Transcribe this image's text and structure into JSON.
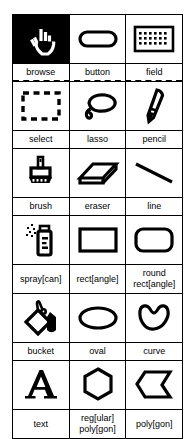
{
  "palette": {
    "title": "tool palette",
    "selected_tool": "browse",
    "colors": {
      "ink": "#000000",
      "paper": "#ffffff",
      "selected_bg": "#000000",
      "selected_fg": "#ffffff"
    },
    "groups": [
      {
        "name": "object-tools",
        "separator_after": "dashed",
        "tools": [
          {
            "id": "browse",
            "label": "browse",
            "label_line2": "",
            "icon": "hand-pointer-icon",
            "selected": true
          },
          {
            "id": "button",
            "label": "button",
            "label_line2": "",
            "icon": "rounded-button-icon",
            "selected": false
          },
          {
            "id": "field",
            "label": "field",
            "label_line2": "",
            "icon": "text-field-grid-icon",
            "selected": false
          }
        ]
      },
      {
        "name": "selection-and-draw-tools",
        "separator_after": "solid",
        "tools": [
          {
            "id": "select",
            "label": "select",
            "label_line2": "",
            "icon": "marquee-select-icon",
            "selected": false
          },
          {
            "id": "lasso",
            "label": "lasso",
            "label_line2": "",
            "icon": "lasso-icon",
            "selected": false
          },
          {
            "id": "pencil",
            "label": "pencil",
            "label_line2": "",
            "icon": "pencil-icon",
            "selected": false
          }
        ]
      },
      {
        "name": "paint-tools",
        "separator_after": "solid",
        "tools": [
          {
            "id": "brush",
            "label": "brush",
            "label_line2": "",
            "icon": "paintbrush-icon",
            "selected": false
          },
          {
            "id": "eraser",
            "label": "eraser",
            "label_line2": "",
            "icon": "eraser-icon",
            "selected": false
          },
          {
            "id": "line",
            "label": "line",
            "label_line2": "",
            "icon": "line-icon",
            "selected": false
          }
        ]
      },
      {
        "name": "shape-tools-1",
        "separator_after": "solid",
        "tools": [
          {
            "id": "spray",
            "label": "spray[can]",
            "label_line2": "",
            "icon": "spray-can-icon",
            "selected": false
          },
          {
            "id": "rect",
            "label": "rect[angle]",
            "label_line2": "",
            "icon": "rectangle-icon",
            "selected": false
          },
          {
            "id": "roundrect",
            "label": "round",
            "label_line2": "rect[angle]",
            "icon": "rounded-rectangle-icon",
            "selected": false
          }
        ]
      },
      {
        "name": "shape-tools-2",
        "separator_after": "solid",
        "tools": [
          {
            "id": "bucket",
            "label": "bucket",
            "label_line2": "",
            "icon": "paint-bucket-icon",
            "selected": false
          },
          {
            "id": "oval",
            "label": "oval",
            "label_line2": "",
            "icon": "oval-icon",
            "selected": false
          },
          {
            "id": "curve",
            "label": "curve",
            "label_line2": "",
            "icon": "curve-icon",
            "selected": false
          }
        ]
      },
      {
        "name": "text-and-polygon-tools",
        "separator_after": "none",
        "tools": [
          {
            "id": "text",
            "label": "text",
            "label_line2": "",
            "icon": "text-letter-a-icon",
            "selected": false
          },
          {
            "id": "regpoly",
            "label": "reg[ular]",
            "label_line2": "poly[gon]",
            "icon": "regular-polygon-icon",
            "selected": false
          },
          {
            "id": "polygon",
            "label": "poly[gon]",
            "label_line2": "",
            "icon": "polygon-icon",
            "selected": false
          }
        ]
      }
    ]
  }
}
